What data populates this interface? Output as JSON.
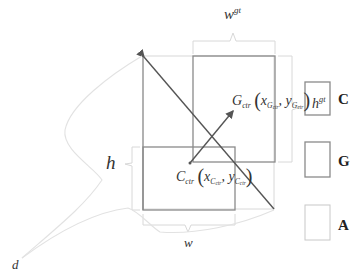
{
  "diagram": {
    "title": "",
    "labels": {
      "w_gt": {
        "base": "w",
        "sup": "gt"
      },
      "h_gt": {
        "base": "h",
        "sup": "gt"
      },
      "w": "w",
      "h": "h",
      "d": "d",
      "g_ctr": {
        "base": "G",
        "sub": "ctr",
        "x": "x",
        "x_sub": "G",
        "x_subsub": "ctr",
        "y": "y",
        "y_sub": "G",
        "y_subsub": "ctr",
        "open": "(",
        "close": ")",
        "comma": ","
      },
      "c_ctr": {
        "base": "C",
        "sub": "ctr",
        "x": "x",
        "x_sub": "C",
        "x_subsub": "ctr",
        "y": "y",
        "y_sub": "C",
        "y_subsub": "ctr",
        "open": "(",
        "close": ")",
        "comma": ","
      }
    },
    "legend": [
      {
        "key": "C",
        "label": "C",
        "stroke": "#8a8a8a"
      },
      {
        "key": "G",
        "label": "G",
        "stroke": "#8a8a8a"
      },
      {
        "key": "A",
        "label": "A",
        "stroke": "#c8c8c8"
      }
    ],
    "colors": {
      "box_stroke": "#8a8a8a",
      "light_stroke": "#d8d8d8",
      "curve_stroke": "#e2e2e2",
      "arrow_stroke": "#555555"
    }
  }
}
